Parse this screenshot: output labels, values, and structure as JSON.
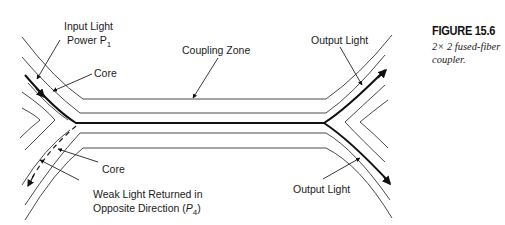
{
  "figure": {
    "number": "FIGURE 15.6",
    "caption": "2× 2 fused-fiber coupler."
  },
  "labels": {
    "input_light_line1": "Input Light",
    "input_light_line2": "Power P",
    "input_light_sub": "1",
    "core_top": "Core",
    "coupling_zone": "Coupling Zone",
    "output_light_top": "Output Light",
    "core_bottom": "Core",
    "weak_light_line1": "Weak Light Returned in",
    "weak_light_line2": "Opposite Direction (",
    "weak_light_var": "P",
    "weak_light_sub": "4",
    "weak_light_close": ")",
    "output_light_bottom": "Output Light"
  },
  "colors": {
    "line": "#4a4a4a",
    "core": "#111111",
    "background": "#ffffff"
  }
}
